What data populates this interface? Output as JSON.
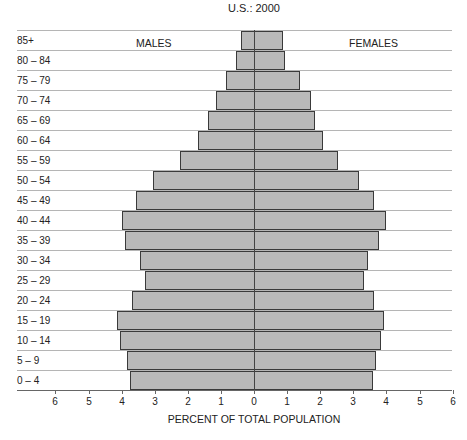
{
  "chart_data": {
    "type": "bar",
    "subtype": "population-pyramid",
    "title": "U.S.: 2000",
    "xlabel": "PERCENT OF TOTAL POPULATION",
    "ylabel": "",
    "left_label": "MALES",
    "right_label": "FEMALES",
    "xlim": [
      -6,
      6
    ],
    "x_ticks": [
      "6",
      "5",
      "4",
      "3",
      "2",
      "1",
      "0",
      "1",
      "2",
      "3",
      "4",
      "5",
      "6"
    ],
    "grid": true,
    "categories": [
      "85+",
      "80 – 84",
      "75 – 79",
      "70 – 74",
      "65 – 69",
      "60 – 64",
      "55 – 59",
      "50 – 54",
      "45 – 49",
      "40 – 44",
      "35 – 39",
      "30 – 34",
      "25 – 29",
      "20 – 24",
      "15 – 19",
      "10 – 14",
      "5 – 9",
      "0 – 4"
    ],
    "series": [
      {
        "name": "MALES",
        "values": [
          0.4,
          0.55,
          0.85,
          1.15,
          1.4,
          1.7,
          2.25,
          3.05,
          3.55,
          4.0,
          3.9,
          3.45,
          3.3,
          3.7,
          4.15,
          4.05,
          3.85,
          3.75
        ]
      },
      {
        "name": "FEMALES",
        "values": [
          0.85,
          0.9,
          1.35,
          1.7,
          1.8,
          2.05,
          2.5,
          3.15,
          3.6,
          3.95,
          3.75,
          3.4,
          3.3,
          3.6,
          3.9,
          3.8,
          3.65,
          3.55
        ]
      }
    ]
  },
  "colors": {
    "bar_fill": "#b9b9b9",
    "bar_outline": "#3a3a3a",
    "gridline": "#b5b5b5"
  }
}
